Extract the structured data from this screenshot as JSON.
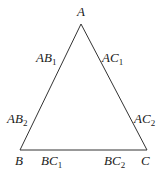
{
  "diagram": {
    "type": "triangle",
    "vertices": {
      "A": {
        "label": "A"
      },
      "B": {
        "label": "B"
      },
      "C": {
        "label": "C"
      }
    },
    "edge_labels": {
      "AB1": {
        "base": "AB",
        "sub": "1"
      },
      "AB2": {
        "base": "AB",
        "sub": "2"
      },
      "AC1": {
        "base": "AC",
        "sub": "1"
      },
      "AC2": {
        "base": "AC",
        "sub": "2"
      },
      "BC1": {
        "base": "BC",
        "sub": "1"
      },
      "BC2": {
        "base": "BC",
        "sub": "2"
      }
    },
    "colors": {
      "stroke": "#333333",
      "text": "#1a1a1a",
      "background": "#ffffff"
    }
  }
}
